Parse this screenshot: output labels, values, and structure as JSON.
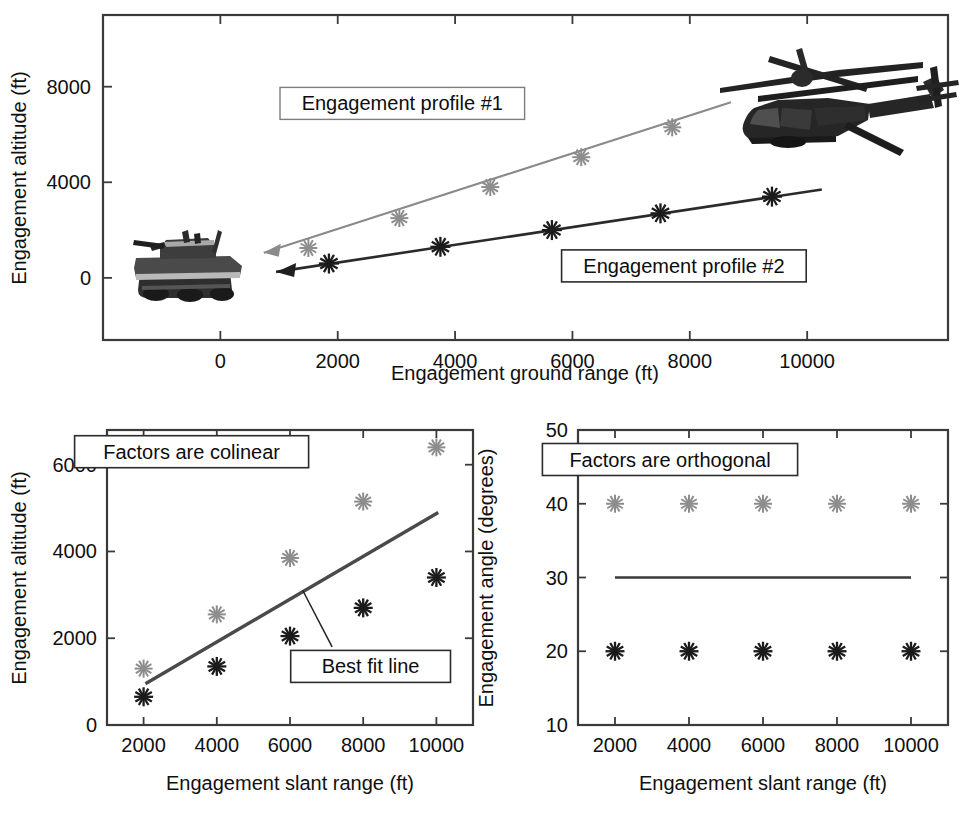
{
  "figure": {
    "background": "#ffffff",
    "colors": {
      "series_gray": "#8a8a8a",
      "series_black": "#2a2a2a",
      "axis": "#3a3a3a",
      "fit_line": "#4a4a4a"
    }
  },
  "chart_data": [
    {
      "type": "line",
      "id": "top-engagement-profiles",
      "title": "",
      "xlabel": "Engagement ground range (ft)",
      "ylabel": "Engagement altitude (ft)",
      "xlim": [
        -2000,
        12400
      ],
      "ylim": [
        -2600,
        11000
      ],
      "xticks": [
        0,
        2000,
        4000,
        6000,
        8000,
        10000
      ],
      "xticklabels": [
        "0",
        "2000",
        "4000",
        "6000",
        "8000",
        "10000"
      ],
      "yticks": [
        0,
        4000,
        8000
      ],
      "yticklabels": [
        "0",
        "4000",
        "8000"
      ],
      "grid": false,
      "legend": "annotations",
      "annotations": [
        {
          "text": "Engagement profile #1",
          "x": 3100,
          "y": 7300
        },
        {
          "text": "Engagement profile #2",
          "x": 7900,
          "y": 500
        }
      ],
      "series": [
        {
          "name": "Engagement profile #1",
          "color": "#8a8a8a",
          "marker": "asterisk",
          "arrow": true,
          "x": [
            1500,
            3050,
            4600,
            6150,
            7700
          ],
          "y": [
            1250,
            2500,
            3800,
            5050,
            6300
          ]
        },
        {
          "name": "Engagement profile #2",
          "color": "#2a2a2a",
          "marker": "asterisk",
          "arrow": true,
          "x": [
            1850,
            3750,
            5650,
            7500,
            9400
          ],
          "y": [
            600,
            1300,
            2000,
            2700,
            3400
          ]
        }
      ],
      "images": [
        {
          "name": "tank-icon",
          "label": "tank"
        },
        {
          "name": "helicopter-icon",
          "label": "helicopter"
        }
      ]
    },
    {
      "type": "scatter",
      "id": "bottom-left-colinear",
      "title": "",
      "xlabel": "Engagement slant range (ft)",
      "ylabel": "Engagement altitude (ft)",
      "xlim": [
        1000,
        11000
      ],
      "ylim": [
        0,
        6800
      ],
      "xticks": [
        2000,
        4000,
        6000,
        8000,
        10000
      ],
      "xticklabels": [
        "2000",
        "4000",
        "6000",
        "8000",
        "10000"
      ],
      "yticks": [
        0,
        2000,
        4000,
        6000
      ],
      "yticklabels": [
        "0",
        "2000",
        "4000",
        "6000"
      ],
      "grid": false,
      "annotations": [
        {
          "text": "Factors are colinear",
          "x": 2000,
          "y": 6300
        },
        {
          "text": "Best fit line",
          "x": 7600,
          "y": 1350
        }
      ],
      "categories": [
        2000,
        4000,
        6000,
        8000,
        10000
      ],
      "series": [
        {
          "name": "upper-profile",
          "color": "#8a8a8a",
          "marker": "asterisk",
          "values": [
            1300,
            2550,
            3850,
            5150,
            6400
          ]
        },
        {
          "name": "lower-profile",
          "color": "#1b1b1b",
          "marker": "asterisk",
          "values": [
            650,
            1350,
            2050,
            2700,
            3400
          ]
        }
      ],
      "fit_line": {
        "name": "Best fit line",
        "color": "#4a4a4a",
        "x": [
          2050,
          10050
        ],
        "y": [
          950,
          4900
        ]
      }
    },
    {
      "type": "scatter",
      "id": "bottom-right-orthogonal",
      "title": "",
      "xlabel": "Engagement slant range (ft)",
      "ylabel": "Engagement angle (degrees)",
      "xlim": [
        1000,
        11000
      ],
      "ylim": [
        10,
        50
      ],
      "xticks": [
        2000,
        4000,
        6000,
        8000,
        10000
      ],
      "xticklabels": [
        "2000",
        "4000",
        "6000",
        "8000",
        "10000"
      ],
      "yticks": [
        10,
        20,
        30,
        40,
        50
      ],
      "yticklabels": [
        "10",
        "20",
        "30",
        "40",
        "50"
      ],
      "grid": false,
      "annotations": [
        {
          "text": "Factors are orthogonal",
          "x": 2000,
          "y": 46
        }
      ],
      "categories": [
        2000,
        4000,
        6000,
        8000,
        10000
      ],
      "series": [
        {
          "name": "upper-angle",
          "color": "#8a8a8a",
          "marker": "asterisk",
          "values": [
            40,
            40,
            40,
            40,
            40
          ]
        },
        {
          "name": "lower-angle",
          "color": "#1b1b1b",
          "marker": "asterisk",
          "values": [
            20,
            20,
            20,
            20,
            20
          ]
        }
      ],
      "fit_line": {
        "name": "mean-line",
        "color": "#3a3a3a",
        "x": [
          2000,
          10000
        ],
        "y": [
          30,
          30
        ]
      }
    }
  ]
}
